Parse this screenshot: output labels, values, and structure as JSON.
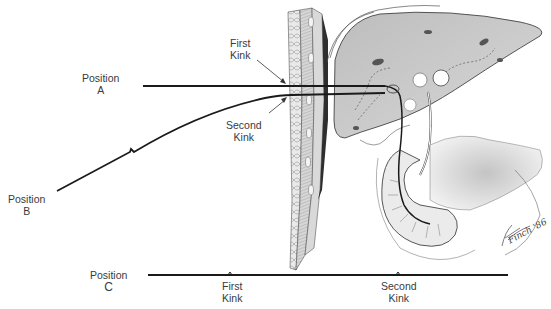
{
  "figure": {
    "colors": {
      "line": "#1a1a1a",
      "tissue": "#cfcfcf",
      "text": "#3a3a3a",
      "background": "#ffffff"
    }
  },
  "labels": {
    "position_a": {
      "line1": "Position",
      "line2": "A"
    },
    "position_b": {
      "line1": "Position",
      "line2": "B"
    },
    "position_c": {
      "line1": "Position",
      "line2": "C"
    },
    "first_kink_top": {
      "line1": "First",
      "line2": "Kink"
    },
    "second_kink_top": {
      "line1": "Second",
      "line2": "Kink"
    },
    "first_kink_bottom": {
      "line1": "First",
      "line2": "Kink"
    },
    "second_kink_bottom": {
      "line1": "Second",
      "line2": "Kink"
    }
  },
  "wall_markers": [
    "SI",
    "IO",
    "EO",
    "TA",
    "R"
  ],
  "signature": "Finch '86"
}
